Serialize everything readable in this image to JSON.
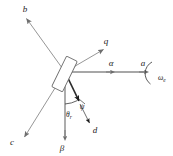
{
  "figure": {
    "type": "vector-axis-diagram",
    "background_color": "#ffffff",
    "stroke_color_light": "#8a8a8a",
    "stroke_color_dark": "#2b2b2b",
    "origin": {
      "x": 65,
      "y": 72
    }
  },
  "axes": [
    {
      "id": "b",
      "label": "b",
      "kind": "stator-phase",
      "tip": {
        "x": 24,
        "y": 16
      },
      "color": "#8a8a8a"
    },
    {
      "id": "c",
      "label": "c",
      "kind": "stator-phase",
      "tip": {
        "x": 22,
        "y": 140
      },
      "color": "#8a8a8a"
    },
    {
      "id": "a",
      "label": "a",
      "kind": "stator-phase",
      "tip": {
        "x": 145,
        "y": 72
      },
      "color": "#8a8a8a"
    },
    {
      "id": "alpha",
      "label": "α",
      "kind": "stationary-frame",
      "tip": {
        "x": 115,
        "y": 72
      },
      "color": "#8a8a8a"
    },
    {
      "id": "beta",
      "label": "β",
      "kind": "stationary-frame",
      "tip": {
        "x": 65,
        "y": 140
      },
      "color": "#8a8a8a"
    },
    {
      "id": "q",
      "label": "q",
      "kind": "rotor-frame",
      "tip": {
        "x": 106,
        "y": 46
      },
      "color": "#8a8a8a"
    },
    {
      "id": "d",
      "label": "d",
      "kind": "rotor-frame",
      "tip": {
        "x": 92,
        "y": 126
      },
      "color": "#2b2b2b"
    }
  ],
  "angles": [
    {
      "id": "theta-r",
      "symbol": "θ",
      "subscript": "r",
      "label": "θr",
      "between": [
        "beta",
        "d"
      ]
    },
    {
      "id": "psi",
      "symbol": "ψ",
      "subscript": "",
      "label": "ψ",
      "between": [
        "d",
        "rotor-axis"
      ]
    }
  ],
  "speed": {
    "id": "omega-e",
    "symbol": "ω",
    "subscript": "e",
    "label": "ωe",
    "arc": "clockwise-indicator"
  },
  "rotor": {
    "id": "rotor-body",
    "shape": "tilted-rectangle",
    "fill": "#ffffff",
    "stroke": "#6e6e6e"
  }
}
